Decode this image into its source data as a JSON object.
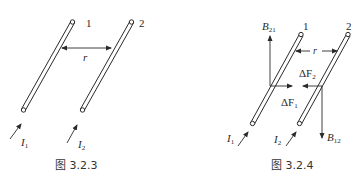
{
  "figures": [
    {
      "id": "left",
      "caption": "图 3.2.3",
      "wire_labels": [
        "1",
        "2"
      ],
      "separation_label": "r",
      "current_labels": [
        {
          "base": "I",
          "sub": "1"
        },
        {
          "base": "I",
          "sub": "2"
        }
      ]
    },
    {
      "id": "right",
      "caption": "图 3.2.4",
      "wire_labels": [
        "1",
        "2"
      ],
      "separation_label": "r",
      "current_labels": [
        {
          "base": "I",
          "sub": "1"
        },
        {
          "base": "I",
          "sub": "2"
        }
      ],
      "field_labels": [
        {
          "base": "B",
          "sub": "21"
        },
        {
          "base": "B",
          "sub": "12"
        }
      ],
      "force_labels": [
        {
          "base": "ΔF",
          "sub": "2"
        },
        {
          "base": "ΔF",
          "sub": "1"
        }
      ]
    }
  ],
  "colors": {
    "line": "#2a2a2a",
    "background": "#ffffff"
  }
}
